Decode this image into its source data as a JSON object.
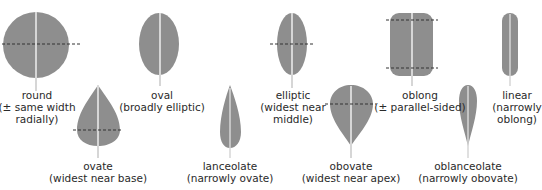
{
  "colors": {
    "leaf_fill": "#8e8e8e",
    "midrib": "#d6d6d6",
    "dashed_line": "#333333",
    "text": "#2a2a2a",
    "background": "#ffffff"
  },
  "shapes": [
    {
      "id": "round",
      "name": "round",
      "lines": [
        "round",
        "(± same width",
        "radially)"
      ]
    },
    {
      "id": "oval",
      "name": "oval",
      "lines": [
        "oval",
        "(broadly elliptic)"
      ]
    },
    {
      "id": "elliptic",
      "name": "elliptic",
      "lines": [
        "elliptic",
        "(widest near",
        "middle)"
      ]
    },
    {
      "id": "oblong",
      "name": "oblong",
      "lines": [
        "oblong",
        "(± parallel-sided)"
      ]
    },
    {
      "id": "linear",
      "name": "linear",
      "lines": [
        "linear",
        "(narrowly",
        "oblong)"
      ]
    },
    {
      "id": "ovate",
      "name": "ovate",
      "lines": [
        "ovate",
        "(widest near base)"
      ]
    },
    {
      "id": "lanceolate",
      "name": "lanceolate",
      "lines": [
        "lanceolate",
        "(narrowly ovate)"
      ]
    },
    {
      "id": "obovate",
      "name": "obovate",
      "lines": [
        "obovate",
        "(widest near apex)"
      ]
    },
    {
      "id": "oblanceolate",
      "name": "oblanceolate",
      "lines": [
        "oblanceolate",
        "(narrowly obovate)"
      ]
    }
  ]
}
